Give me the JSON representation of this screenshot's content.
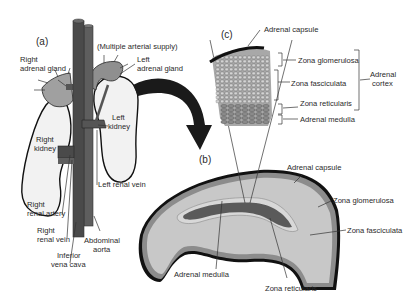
{
  "figure": {
    "panels": {
      "a": "(a)",
      "b": "(b)",
      "c": "(c)"
    },
    "panel_a": {
      "labels": {
        "multiple_arterial_supply": "(Multiple arterial supply)",
        "right_adrenal_gland_1": "Right",
        "right_adrenal_gland_2": "adrenal gland",
        "left_adrenal_gland_1": "Left",
        "left_adrenal_gland_2": "adrenal gland",
        "left_kidney_1": "Left",
        "left_kidney_2": "kidney",
        "right_kidney_1": "Right",
        "right_kidney_2": "kidney",
        "left_renal_vein": "Left renal vein",
        "right_renal_artery_1": "Right",
        "right_renal_artery_2": "renal artery",
        "right_renal_vein_1": "Right",
        "right_renal_vein_2": "renal vein",
        "abdominal_aorta_1": "Abdominal",
        "abdominal_aorta_2": "aorta",
        "inferior_vena_cava_1": "Inferior",
        "inferior_vena_cava_2": "vena cava"
      }
    },
    "panel_b": {
      "labels": {
        "adrenal_capsule": "Adrenal capsule",
        "zona_glomerulosa": "Zona glomerulosa",
        "zona_fasciculata": "Zona fasciculata",
        "adrenal_medulla": "Adrenal medulla",
        "zona_reticularis": "Zona reticularis"
      }
    },
    "panel_c": {
      "labels": {
        "adrenal_capsule": "Adrenal capsule",
        "zona_glomerulosa": "Zona glomerulosa",
        "zona_fasciculata": "Zona fasciculata",
        "zona_reticularis": "Zona reticularis",
        "adrenal_medulla": "Adrenal medulla",
        "adrenal_cortex_1": "Adrenal",
        "adrenal_cortex_2": "cortex"
      }
    },
    "colors": {
      "vessel_dark": "#4a4a4a",
      "vessel_mid": "#5e5e5e",
      "gland": "#9a9a9a",
      "kidney": "#f0f0f0",
      "capsule": "#111111",
      "glomerulosa": "#8c8c8c",
      "fasciculata": "#c8c8c8",
      "reticularis": "#d8d8d8",
      "medulla": "#5a5a5a"
    }
  }
}
